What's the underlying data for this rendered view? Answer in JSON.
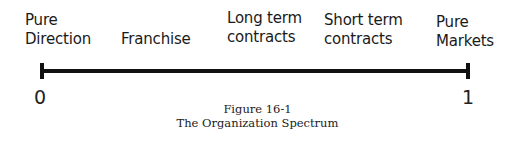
{
  "spectrum": {
    "labels": [
      {
        "line1": "Pure",
        "line2": "Direction"
      },
      {
        "line1": "",
        "line2": "Franchise"
      },
      {
        "line1": "Long term",
        "line2": "contracts"
      },
      {
        "line1": "Short term",
        "line2": "contracts"
      },
      {
        "line1": "Pure",
        "line2": "Markets"
      }
    ],
    "min_value": "0",
    "max_value": "1"
  },
  "caption": {
    "figure": "Figure 16-1",
    "title": "The Organization Spectrum"
  }
}
